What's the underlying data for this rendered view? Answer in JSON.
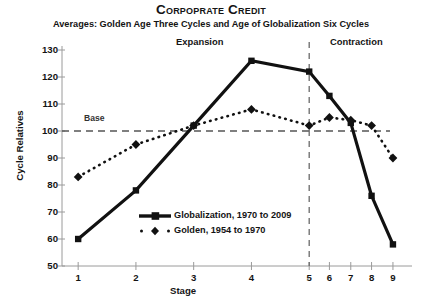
{
  "header": {
    "title": "Corpoprate Credit",
    "subtitle": "Averages: Golden Age Three Cycles and Age of Globalization Six Cycles"
  },
  "annotations": {
    "expansion": "Expansion",
    "contraction": "Contraction",
    "base": "Base"
  },
  "axes": {
    "y_title": "Cycle Relatives",
    "x_title": "Stage"
  },
  "legend": {
    "items": [
      {
        "label": "Globalization, 1970 to 2009",
        "style": "solid-square",
        "color": "#111111"
      },
      {
        "label": "Golden, 1954 to 1970",
        "style": "dotted-diamond",
        "color": "#111111"
      }
    ]
  },
  "chart_data": {
    "type": "line",
    "title": "Corpoprate Credit",
    "subtitle": "Averages: Golden Age Three Cycles and Age of Globalization Six Cycles",
    "xlabel": "Stage",
    "ylabel": "Cycle Relatives",
    "categories": [
      "1",
      "2",
      "3",
      "4",
      "5",
      "6",
      "7",
      "8",
      "9"
    ],
    "x_positions": [
      0,
      1,
      2,
      3,
      4,
      4.35,
      4.72,
      5.08,
      5.45
    ],
    "xlim": [
      -0.28,
      5.78
    ],
    "ylim": [
      50,
      130
    ],
    "yticks": [
      50,
      60,
      70,
      80,
      90,
      100,
      110,
      120,
      130
    ],
    "grid": false,
    "legend_position": "inside-lower-left",
    "reference_lines": [
      {
        "name": "base",
        "orientation": "horizontal",
        "value": 100,
        "style": "dashed",
        "label": "Base"
      },
      {
        "name": "phase-divider",
        "orientation": "vertical",
        "value": 5,
        "style": "dashed",
        "label": ""
      }
    ],
    "series": [
      {
        "name": "Globalization, 1970 to 2009",
        "marker": "square",
        "line": "solid",
        "color": "#111111",
        "values": [
          60,
          78,
          102,
          126,
          122,
          113,
          103,
          76,
          58
        ]
      },
      {
        "name": "Golden, 1954 to 1970",
        "marker": "diamond",
        "line": "dotted",
        "color": "#111111",
        "values": [
          83,
          95,
          102,
          108,
          102,
          105,
          104,
          102,
          90
        ]
      }
    ]
  }
}
